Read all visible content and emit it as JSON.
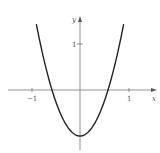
{
  "chart_data": {
    "type": "line",
    "title": "",
    "xlabel": "x",
    "ylabel": "y",
    "function": "y = 3x^2 - 1",
    "series": [
      {
        "name": "parabola",
        "x": [
          -0.9,
          -0.8,
          -0.7,
          -0.6,
          -0.5,
          -0.4,
          -0.3,
          -0.2,
          -0.1,
          0,
          0.1,
          0.2,
          0.3,
          0.4,
          0.5,
          0.6,
          0.7,
          0.8,
          0.9
        ],
        "y": [
          1.43,
          0.92,
          0.47,
          0.08,
          -0.25,
          -0.52,
          -0.73,
          -0.88,
          -0.97,
          -1.0,
          -0.97,
          -0.88,
          -0.73,
          -0.52,
          -0.25,
          0.08,
          0.47,
          0.92,
          1.43
        ]
      }
    ],
    "x_ticks": [
      {
        "value": -1,
        "label": "−1"
      },
      {
        "value": 1,
        "label": "1"
      }
    ],
    "y_ticks": [
      {
        "value": 1,
        "label": "1"
      }
    ],
    "xlim": [
      -1.5,
      1.5
    ],
    "ylim": [
      -1.3,
      1.6
    ],
    "grid": false,
    "legend": null
  },
  "labels": {
    "x_axis": "x",
    "y_axis": "y",
    "x_tick_neg1": "−1",
    "x_tick_1": "1",
    "y_tick_1": "1"
  }
}
